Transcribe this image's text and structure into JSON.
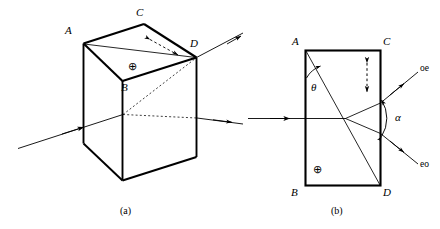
{
  "figure": {
    "type": "optics-diagram",
    "stroke_color": "#000000",
    "background_color": "#ffffff"
  },
  "panel_a": {
    "caption": "(a)",
    "vertex_labels": {
      "A": "A",
      "B": "B",
      "C": "C",
      "D": "D"
    },
    "optic_axis_symbol": "⊕",
    "geometry": {
      "top_face": [
        [
          83,
          43
        ],
        [
          144,
          24
        ],
        [
          196,
          57
        ],
        [
          122,
          81
        ]
      ],
      "front_left_face": [
        [
          83,
          43
        ],
        [
          122,
          81
        ],
        [
          122,
          180
        ],
        [
          83,
          143
        ]
      ],
      "front_right_face": [
        [
          122,
          81
        ],
        [
          196,
          57
        ],
        [
          196,
          157
        ],
        [
          122,
          180
        ]
      ],
      "bottom_visible": [
        [
          83,
          143
        ],
        [
          122,
          180
        ],
        [
          196,
          157
        ]
      ],
      "diagonal_AD": [
        [
          83,
          43
        ],
        [
          196,
          57
        ]
      ]
    },
    "rays": {
      "incident": {
        "from": [
          18,
          148
        ],
        "to": [
          122,
          114
        ],
        "arrow_at": [
          78,
          128
        ]
      },
      "internal_dotted_upper": {
        "from": [
          122,
          114
        ],
        "to": [
          196,
          57
        ]
      },
      "internal_dotted_lower": {
        "from": [
          122,
          114
        ],
        "to": [
          196,
          118
        ]
      },
      "exit_upper": {
        "from": [
          196,
          57
        ],
        "to": [
          243,
          33
        ],
        "arrow_at": [
          222,
          44
        ]
      },
      "exit_lower": {
        "from": [
          196,
          118
        ],
        "to": [
          243,
          124
        ],
        "arrow_at": [
          222,
          121
        ]
      }
    },
    "polarization_marker": {
      "style": "dashed-double-arrow",
      "from": [
        146,
        38
      ],
      "to": [
        182,
        58
      ],
      "meaning": "in-plane polarization direction on top face"
    }
  },
  "panel_b": {
    "caption": "(b)",
    "vertex_labels": {
      "A": "A",
      "B": "B",
      "C": "C",
      "D": "D"
    },
    "angle_labels": {
      "theta": "θ",
      "alpha": "α"
    },
    "ray_labels": {
      "upper": "oe",
      "lower": "eo"
    },
    "optic_axis_symbol": "⊕",
    "geometry": {
      "rect": {
        "x": 305,
        "y": 50,
        "width": 75,
        "height": 135
      },
      "optic_axis_line": {
        "from": [
          305,
          50
        ],
        "to": [
          380,
          185
        ]
      },
      "split_point": [
        345,
        118
      ]
    },
    "rays": {
      "incident": {
        "from": [
          248,
          118
        ],
        "to": [
          345,
          118
        ],
        "arrow_at": [
          285,
          118
        ]
      },
      "branch_upper_internal": {
        "from": [
          345,
          118
        ],
        "to": [
          380,
          103
        ]
      },
      "branch_lower_internal": {
        "from": [
          345,
          118
        ],
        "to": [
          380,
          133
        ]
      },
      "exit_oe": {
        "from": [
          380,
          103
        ],
        "to": [
          418,
          72
        ],
        "arrow_at": [
          400,
          87
        ]
      },
      "exit_eo": {
        "from": [
          380,
          133
        ],
        "to": [
          418,
          163
        ],
        "arrow_at": [
          400,
          148
        ]
      }
    },
    "polarization_marker": {
      "style": "dashed-double-arrow-vertical",
      "from": [
        367,
        62
      ],
      "to": [
        367,
        92
      ],
      "meaning": "vertical polarization direction inside crystal"
    }
  }
}
